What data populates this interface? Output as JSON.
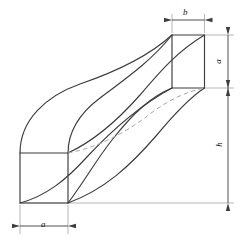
{
  "figure": {
    "type": "engineering-orthographic-pictorial",
    "background_color": "#ffffff",
    "line_color": "#3c3c3c",
    "thin_line_color": "#9a9a9a",
    "hidden_line_color": "#a8a8a8"
  },
  "dimensions": [
    {
      "id": "b",
      "label": "b",
      "orientation": "horizontal",
      "position": "top",
      "description": "width of upper square face"
    },
    {
      "id": "a-right",
      "label": "a",
      "orientation": "vertical",
      "position": "right-upper",
      "description": "height of upper square face"
    },
    {
      "id": "h",
      "label": "h",
      "orientation": "vertical",
      "position": "right-lower",
      "description": "overall height of the solid"
    },
    {
      "id": "a-bottom",
      "label": "a",
      "orientation": "horizontal",
      "position": "bottom",
      "description": "width of lower square face"
    }
  ],
  "geometry": {
    "upper_face": {
      "name": "upper-square-face",
      "left": 172,
      "right": 204,
      "top": 35,
      "bottom": 88
    },
    "lower_face": {
      "name": "lower-square-face",
      "left": 20,
      "right": 68,
      "top": 153,
      "bottom": 203
    },
    "curves": {
      "count": 6,
      "hidden_count": 2,
      "style": "warped ruled surface edges"
    }
  }
}
